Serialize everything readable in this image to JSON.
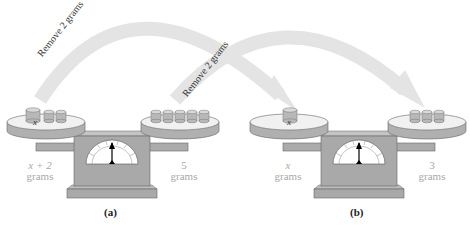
{
  "diagram": {
    "arrows": [
      {
        "label": "Remove 2 grams",
        "from": "left-pan-a",
        "to": "left-pan-b"
      },
      {
        "label": "Remove 2 grams",
        "from": "right-pan-a",
        "to": "right-pan-b"
      }
    ],
    "panels": [
      {
        "caption": "(a)",
        "left_pan": {
          "unknown_weight_label": "x",
          "unit_weights": 2,
          "label_line1": "x + 2",
          "label_line2": "grams"
        },
        "right_pan": {
          "unit_weights": 5,
          "label_line1": "5",
          "label_line2": "grams"
        }
      },
      {
        "caption": "(b)",
        "left_pan": {
          "unknown_weight_label": "x",
          "unit_weights": 0,
          "label_line1": "x",
          "label_line2": "grams"
        },
        "right_pan": {
          "unit_weights": 3,
          "label_line1": "3",
          "label_line2": "grams"
        }
      }
    ],
    "colors": {
      "arrow": "#e4e4e4",
      "scale_body": "#a9a9a9",
      "pan_top": "#f1f1f1",
      "weight": "#b8b8b8",
      "label": "#a8a8a8"
    }
  }
}
